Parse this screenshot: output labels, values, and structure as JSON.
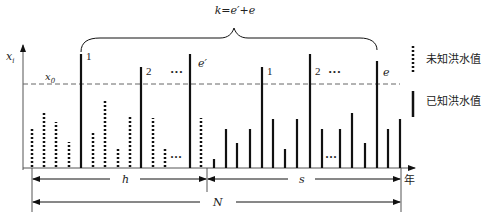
{
  "diagram": {
    "title_formula": "k=e′+e",
    "y_axis_label": "x",
    "y_axis_subscript": "i",
    "threshold_label": "x",
    "threshold_subscript": "0",
    "x_axis_label": "年",
    "span_labels": {
      "h": "h",
      "s": "s",
      "N": "N"
    },
    "peak_labels": {
      "h1": "1",
      "h2": "2",
      "h_ellipsis": "···",
      "h_last": "e′",
      "s1": "1",
      "s2": "2",
      "s_ellipsis": "···",
      "s_last": "e"
    },
    "low_ellipsis": "···",
    "legend": [
      {
        "style": "dotted",
        "label": "未知洪水值"
      },
      {
        "style": "solid",
        "label": "已知洪水值"
      }
    ]
  },
  "colors": {
    "ink": "#111111",
    "axis": "#555555",
    "dashed": "#666666"
  },
  "geometry": {
    "baseline_y": 168,
    "threshold_y": 84,
    "axis_x": 23,
    "dotted_bars": [
      {
        "x": 32,
        "top": 129
      },
      {
        "x": 44,
        "top": 113
      },
      {
        "x": 56,
        "top": 122
      },
      {
        "x": 69,
        "top": 142
      },
      {
        "x": 93,
        "top": 133
      },
      {
        "x": 105,
        "top": 100
      },
      {
        "x": 118,
        "top": 148
      },
      {
        "x": 130,
        "top": 117
      },
      {
        "x": 153,
        "top": 118
      },
      {
        "x": 165,
        "top": 149
      },
      {
        "x": 201,
        "top": 118
      }
    ],
    "solid_bars": [
      {
        "x": 81,
        "top": 54
      },
      {
        "x": 141,
        "top": 67
      },
      {
        "x": 190,
        "top": 54
      },
      {
        "x": 214,
        "top": 159
      },
      {
        "x": 226,
        "top": 129
      },
      {
        "x": 237,
        "top": 143
      },
      {
        "x": 250,
        "top": 129
      },
      {
        "x": 262,
        "top": 67
      },
      {
        "x": 273,
        "top": 119
      },
      {
        "x": 285,
        "top": 149
      },
      {
        "x": 297,
        "top": 119
      },
      {
        "x": 310,
        "top": 54
      },
      {
        "x": 322,
        "top": 129
      },
      {
        "x": 340,
        "top": 129
      },
      {
        "x": 352,
        "top": 113
      },
      {
        "x": 365,
        "top": 143
      },
      {
        "x": 377,
        "top": 61
      },
      {
        "x": 388,
        "top": 129
      },
      {
        "x": 400,
        "top": 119
      }
    ]
  }
}
